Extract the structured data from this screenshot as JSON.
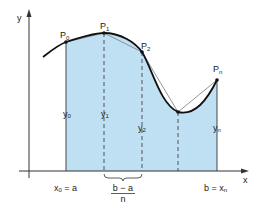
{
  "diagram": {
    "axes": {
      "x_label": "x",
      "y_label": "y"
    },
    "points": [
      {
        "label": "P",
        "sub": "0"
      },
      {
        "label": "P",
        "sub": "1"
      },
      {
        "label": "P",
        "sub": "2"
      },
      {
        "label": "P",
        "sub": "n"
      }
    ],
    "ordinates": [
      {
        "label": "y",
        "sub": "0"
      },
      {
        "label": "y",
        "sub": "1"
      },
      {
        "label": "y",
        "sub": "2"
      },
      {
        "label": "y",
        "sub": "n"
      }
    ],
    "x_start": {
      "lhs": "x",
      "sub": "0",
      "rhs": " = a"
    },
    "x_end": {
      "lhs": "b = x",
      "sub": "n"
    },
    "interval": {
      "numerator": "b − a",
      "denominator": "n"
    },
    "colors": {
      "fill": "#bfe0f2",
      "curve": "#111111",
      "chord": "#777777",
      "axis": "#333333"
    }
  }
}
